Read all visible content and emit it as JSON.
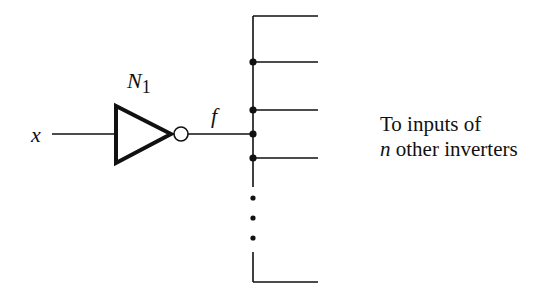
{
  "diagram": {
    "type": "logic-circuit-fanout",
    "input_label": "x",
    "gate": {
      "kind": "inverter",
      "name": "N",
      "subscript": "1"
    },
    "output_label": "f",
    "annotation": {
      "line1": "To inputs of",
      "line2_var": "n",
      "line2_rest": " other inverters"
    },
    "fanout_branches": 6,
    "ellipsis": "vertical dots",
    "colors": {
      "stroke": "#111111",
      "background": "#ffffff"
    }
  }
}
